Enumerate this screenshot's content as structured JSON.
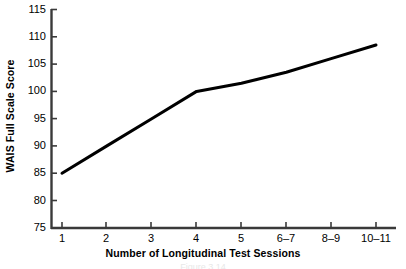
{
  "chart_data": {
    "type": "line",
    "title": "",
    "xlabel": "Number of Longitudinal Test Sessions",
    "ylabel": "WAIS Full Scale Score",
    "categories": [
      "1",
      "2",
      "3",
      "4",
      "5",
      "6–7",
      "8–9",
      "10–11"
    ],
    "values": [
      85,
      90,
      95,
      100,
      101.5,
      103.5,
      106,
      108.5
    ],
    "yticks": [
      75,
      80,
      85,
      90,
      95,
      100,
      105,
      110,
      115
    ],
    "ylim": [
      75,
      115
    ],
    "grid": false,
    "legend": null,
    "line_color": "#000000",
    "line_width": 3,
    "markers": false
  },
  "axes": {
    "y_label": "WAIS Full Scale Score",
    "x_label": "Number of Longitudinal Test Sessions",
    "y_tick_labels": [
      "115",
      "110",
      "105",
      "100",
      "95",
      "90",
      "85",
      "80",
      "75"
    ],
    "x_tick_labels": [
      "1",
      "2",
      "3",
      "4",
      "5",
      "6–7",
      "8–9",
      "10–11"
    ]
  },
  "caption": {
    "text": "Figure 3.14"
  },
  "colors": {
    "axis": "#3a3a3a",
    "line": "#111111",
    "background": "#ffffff",
    "text": "#000000"
  }
}
